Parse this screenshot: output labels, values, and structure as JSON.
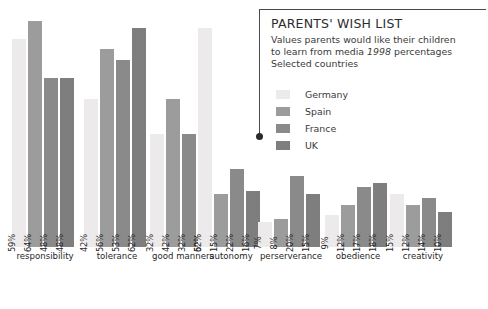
{
  "callout": {
    "title": "PARENTS' WISH LIST",
    "subtitle_line1": "Values parents would like their children",
    "subtitle_line2_pre": "to learn from media ",
    "subtitle_line2_year": "1998",
    "subtitle_line2_post": " percentages",
    "subtitle_line3": "Selected countries"
  },
  "colors": {
    "germany": "#eceaea",
    "spain": "#9c9c9c",
    "france": "#8a8a8a",
    "uk": "#7e7e7e",
    "rule": "#4a4a4a",
    "dot": "#2b2b2b",
    "text": "#2d2d2d",
    "background": "#ffffff"
  },
  "chart_data": {
    "type": "bar",
    "title": "PARENTS' WISH LIST",
    "subtitle": "Values parents would like their children to learn from media 1998 percentages Selected countries",
    "xlabel": "",
    "ylabel": "",
    "ylim": [
      0,
      70
    ],
    "grid": false,
    "legend_position": "top-right",
    "units": "%",
    "categories": [
      "responsibility",
      "tolerance",
      "good manners",
      "autonomy",
      "perserverance",
      "obedience",
      "creativity"
    ],
    "series": [
      {
        "name": "Germany",
        "color": "#eceaea",
        "values": [
          59,
          42,
          32,
          62,
          7,
          9,
          15
        ],
        "labels": [
          "59%",
          "42%",
          "32%",
          "62%",
          "7%",
          "9%",
          "15%"
        ]
      },
      {
        "name": "Spain",
        "color": "#9c9c9c",
        "values": [
          64,
          56,
          42,
          15,
          8,
          12,
          12
        ],
        "labels": [
          "64%",
          "56%",
          "42%",
          "15%",
          "8%",
          "12%",
          "12%"
        ]
      },
      {
        "name": "France",
        "color": "#8a8a8a",
        "values": [
          48,
          53,
          32,
          22,
          20,
          17,
          14
        ],
        "labels": [
          "48%",
          "53%",
          "32%",
          "22%",
          "20%",
          "17%",
          "14%"
        ]
      },
      {
        "name": "UK",
        "color": "#7e7e7e",
        "values": [
          48,
          62,
          50,
          16,
          15,
          18,
          10
        ],
        "labels": [
          "48%",
          "62%",
          "50%",
          "16%",
          "15%",
          "18%",
          "10%"
        ]
      }
    ]
  }
}
